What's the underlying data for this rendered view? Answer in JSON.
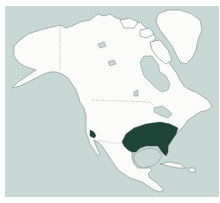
{
  "map": {
    "title": "",
    "region": "North America",
    "colors": {
      "sea": "#c8d8d4",
      "land": "#fbfbf9",
      "coastline": "#7a8a86",
      "range_highlight": "#1f4538"
    },
    "highlighted_areas": [
      {
        "name": "range-southeastern-us",
        "description": "Southern / southeastern United States (Texas to Atlantic coast)"
      },
      {
        "name": "range-california-coast",
        "description": "Small area on southern California coast"
      }
    ],
    "borders": [
      "Alaska-Canada",
      "Canada-USA",
      "USA-Mexico"
    ],
    "labels": []
  }
}
